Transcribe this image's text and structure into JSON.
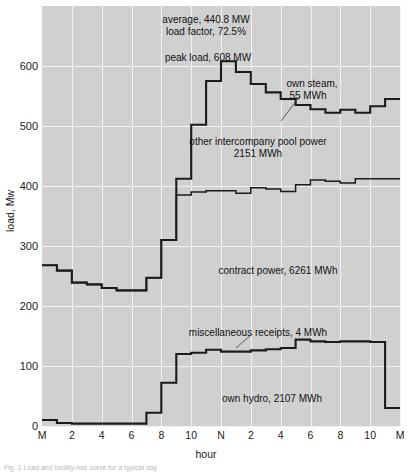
{
  "figure": {
    "caption": "Fig. 1  Load and facility-mix curve for a typical day",
    "background_color": "#d0d0d0",
    "gridline_color": "#f2f2f2",
    "curve_color": "#1b1b1b"
  },
  "axes": {
    "y_label": "load, Mw",
    "y_ticks": [
      "600",
      "500",
      "400",
      "300",
      "200",
      "100",
      "0"
    ],
    "y_tick_values": [
      600,
      500,
      400,
      300,
      200,
      100,
      0
    ],
    "y_min": 0,
    "y_max": 700,
    "x_label": "hour",
    "x_ticks": [
      "M",
      "2",
      "4",
      "6",
      "8",
      "10",
      "N",
      "2",
      "4",
      "6",
      "8",
      "10",
      "M"
    ],
    "x_tick_hours": [
      0,
      2,
      4,
      6,
      8,
      10,
      12,
      14,
      16,
      18,
      20,
      22,
      24
    ],
    "x_min": 0,
    "x_max": 24
  },
  "annotations": [
    {
      "name": "average-load",
      "text": "average, 440.8 MW",
      "x": 206,
      "y": 14,
      "align": "center"
    },
    {
      "name": "load-factor",
      "text": "load factor, 72.5%",
      "x": 206,
      "y": 26,
      "align": "center"
    },
    {
      "name": "peak-load",
      "text": "peak load, 608 MW",
      "x": 208,
      "y": 52,
      "align": "center"
    },
    {
      "name": "own-steam",
      "text": "own steam,",
      "x": 312,
      "y": 78,
      "align": "center"
    },
    {
      "name": "own-steam-value",
      "text": "55 MWh",
      "x": 308,
      "y": 90,
      "align": "center"
    },
    {
      "name": "intercompany-pool-power",
      "text": "other intercompany pool power",
      "x": 258,
      "y": 136,
      "align": "center"
    },
    {
      "name": "intercompany-pool-power-value",
      "text": "2151 MWh",
      "x": 258,
      "y": 148,
      "align": "center"
    },
    {
      "name": "contract-power",
      "text": "contract power, 6261 MWh",
      "x": 278,
      "y": 265,
      "align": "center"
    },
    {
      "name": "miscellaneous-receipts",
      "text": "miscellaneous receipts, 4 MWh",
      "x": 258,
      "y": 327,
      "align": "center"
    },
    {
      "name": "own-hydro",
      "text": "own hydro, 2107 MWh",
      "x": 272,
      "y": 393,
      "align": "center"
    }
  ],
  "leader_lines": [
    {
      "name": "own-steam-leader",
      "x1": 300,
      "y1": 96,
      "x2": 281,
      "y2": 121
    },
    {
      "name": "miscellaneous-receipts-leader",
      "x1": 252,
      "y1": 334,
      "x2": 236,
      "y2": 348
    }
  ],
  "chart_data": {
    "type": "line",
    "subtype": "step-area stacked daily load curve",
    "title": "",
    "xlabel": "hour",
    "ylabel": "load, Mw",
    "xlim": [
      0,
      24
    ],
    "ylim": [
      0,
      700
    ],
    "grid": true,
    "legend_position": "inline-annotations",
    "x_tick_labels": [
      "M",
      "2",
      "4",
      "6",
      "8",
      "10",
      "N",
      "2",
      "4",
      "6",
      "8",
      "10",
      "M"
    ],
    "summary": {
      "average_load_mw": 440.8,
      "load_factor_percent": 72.5,
      "peak_load_mw": 608,
      "own_steam_mwh": 55,
      "other_intercompany_pool_power_mwh": 2151,
      "contract_power_mwh": 6261,
      "miscellaneous_receipts_mwh": 4,
      "own_hydro_mwh": 2107
    },
    "hours": [
      0,
      1,
      2,
      3,
      4,
      5,
      6,
      7,
      8,
      9,
      10,
      11,
      12,
      13,
      14,
      15,
      16,
      17,
      18,
      19,
      20,
      21,
      22,
      23
    ],
    "series": [
      {
        "name": "total load (top curve)",
        "units": "MW",
        "values": [
          268,
          259,
          239,
          236,
          230,
          226,
          226,
          247,
          310,
          412,
          502,
          575,
          608,
          590,
          570,
          556,
          545,
          535,
          528,
          522,
          527,
          522,
          533,
          545
        ]
      },
      {
        "name": "cumulative hydro + contract (middle curve)",
        "units": "MW",
        "values": [
          268,
          259,
          239,
          236,
          230,
          226,
          226,
          247,
          310,
          385,
          390,
          392,
          392,
          388,
          397,
          395,
          391,
          402,
          410,
          408,
          405,
          412,
          412,
          412
        ]
      },
      {
        "name": "own hydro (bottom curve)",
        "units": "MW",
        "values": [
          10,
          5,
          4,
          4,
          4,
          4,
          4,
          22,
          72,
          120,
          122,
          127,
          124,
          124,
          126,
          128,
          130,
          144,
          141,
          140,
          141,
          141,
          140,
          30
        ]
      }
    ]
  }
}
